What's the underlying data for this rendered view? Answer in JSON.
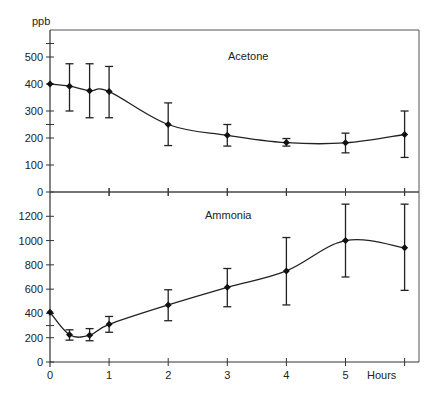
{
  "chart_data": [
    {
      "type": "line",
      "title": "Acetone",
      "ylabel": "ppb",
      "xlabel": "Hours",
      "ylim": [
        0,
        600
      ],
      "yticks": [
        0,
        100,
        200,
        300,
        400,
        500
      ],
      "x": [
        0,
        0.33,
        0.67,
        1,
        2,
        3,
        4,
        5,
        6
      ],
      "series": [
        {
          "name": "Acetone",
          "values": [
            400,
            392,
            375,
            372,
            250,
            210,
            183,
            182,
            213
          ],
          "error_low": [
            400,
            300,
            275,
            275,
            172,
            170,
            170,
            145,
            128
          ],
          "error_high": [
            400,
            475,
            475,
            465,
            330,
            250,
            198,
            218,
            300
          ]
        }
      ],
      "grid": false
    },
    {
      "type": "line",
      "title": "Ammonia",
      "ylabel": "ppb",
      "xlabel": "Hours",
      "ylim": [
        0,
        1400
      ],
      "yticks": [
        0,
        200,
        400,
        600,
        800,
        1000,
        1200
      ],
      "x": [
        0,
        0.33,
        0.67,
        1,
        2,
        3,
        4,
        5,
        6
      ],
      "xticks": [
        "0",
        "1",
        "2",
        "3",
        "4",
        "5"
      ],
      "series": [
        {
          "name": "Ammonia",
          "values": [
            410,
            225,
            220,
            310,
            470,
            615,
            750,
            1000,
            940
          ],
          "error_low": [
            410,
            180,
            175,
            245,
            340,
            455,
            470,
            700,
            590
          ],
          "error_high": [
            410,
            265,
            275,
            375,
            595,
            770,
            1025,
            1300,
            1300
          ]
        }
      ],
      "grid": false
    }
  ],
  "labels": {
    "y_unit": "ppb",
    "x_unit": "Hours",
    "top_title": "Acetone",
    "bottom_title": "Ammonia",
    "top_yticks": [
      "0",
      "100",
      "200",
      "300",
      "400",
      "500"
    ],
    "bottom_yticks": [
      "0",
      "200",
      "400",
      "600",
      "800",
      "1000",
      "1200"
    ],
    "xticks": [
      "0",
      "1",
      "2",
      "3",
      "4",
      "5"
    ]
  }
}
